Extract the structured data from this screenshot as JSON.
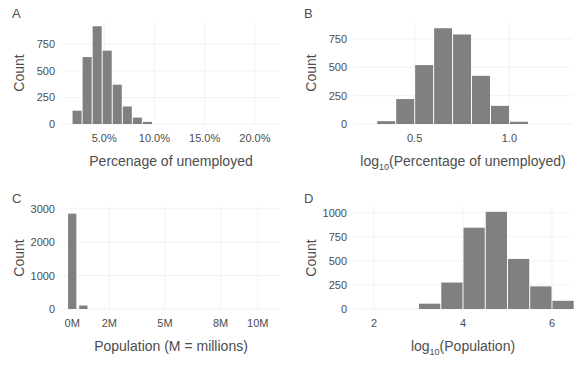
{
  "figure": {
    "width": 584,
    "height": 371,
    "background": "#ffffff",
    "bar_color": "#808080",
    "grid_color": "#f2f2f2",
    "text_color": "#4d4d4d"
  },
  "panels": [
    {
      "letter": "A",
      "ylabel": "Count",
      "xlabel": "Percenage of unemployed"
    },
    {
      "letter": "B",
      "ylabel": "Count",
      "xlabel_main": "log",
      "xlabel_sub": "10",
      "xlabel_rest": "(Percentage of unemployed)"
    },
    {
      "letter": "C",
      "ylabel": "Count",
      "xlabel": "Population (M = millions)"
    },
    {
      "letter": "D",
      "ylabel": "Count",
      "xlabel_main": "log",
      "xlabel_sub": "10",
      "xlabel_rest": "(Population)"
    }
  ],
  "chart_data": [
    {
      "type": "bar",
      "panel": "A",
      "title": "",
      "xlabel": "Percenage of unemployed",
      "ylabel": "Count",
      "xticks": [
        5,
        10,
        15,
        20
      ],
      "xticklabels": [
        "5.0%",
        "10.0%",
        "15.0%",
        "20.0%"
      ],
      "yticks": [
        0,
        250,
        500,
        750
      ],
      "yticklabels": [
        "0",
        "250",
        "500",
        "750"
      ],
      "xlim": [
        0.8,
        22.5
      ],
      "ylim": [
        0,
        960
      ],
      "bin_width": 1.0,
      "bin_starts": [
        1.8,
        2.8,
        3.8,
        4.8,
        5.8,
        6.8,
        7.8,
        8.8
      ],
      "values": [
        125,
        630,
        920,
        690,
        370,
        165,
        60,
        20
      ],
      "grid": true,
      "legend": "none"
    },
    {
      "type": "bar",
      "panel": "B",
      "title": "",
      "xlabel": "log10(Percentage of unemployed)",
      "ylabel": "Count",
      "xticks": [
        0.5,
        1.0
      ],
      "xticklabels": [
        "0.5",
        "1.0"
      ],
      "yticks": [
        0,
        250,
        500,
        750
      ],
      "yticklabels": [
        "0",
        "250",
        "500",
        "750"
      ],
      "xlim": [
        0.18,
        1.33
      ],
      "ylim": [
        0,
        900
      ],
      "bin_width": 0.1,
      "bin_starts": [
        0.3,
        0.4,
        0.5,
        0.6,
        0.7,
        0.8,
        0.9,
        1.0
      ],
      "values": [
        25,
        220,
        520,
        845,
        790,
        425,
        160,
        20
      ],
      "grid": true,
      "legend": "none"
    },
    {
      "type": "bar",
      "panel": "C",
      "title": "",
      "xlabel": "Population (M = millions)",
      "ylabel": "Count",
      "xticks": [
        0,
        2,
        5,
        8,
        10
      ],
      "xticklabels": [
        "0M",
        "2M",
        "5M",
        "8M",
        "10M"
      ],
      "yticks": [
        0,
        1000,
        2000,
        3000
      ],
      "yticklabels": [
        "0",
        "1000",
        "2000",
        "3000"
      ],
      "xlim": [
        -0.55,
        11.2
      ],
      "ylim": [
        0,
        3050
      ],
      "bin_width": 0.5,
      "bin_starts": [
        -0.25,
        0.35
      ],
      "values": [
        2850,
        105
      ],
      "grid": true,
      "legend": "none"
    },
    {
      "type": "bar",
      "panel": "D",
      "title": "",
      "xlabel": "log10(Population)",
      "ylabel": "Count",
      "xticks": [
        2,
        4,
        6
      ],
      "xticklabels": [
        "2",
        "4",
        "6"
      ],
      "yticks": [
        0,
        250,
        500,
        750,
        1000
      ],
      "yticklabels": [
        "0",
        "250",
        "500",
        "750",
        "1000"
      ],
      "xlim": [
        1.55,
        6.45
      ],
      "ylim": [
        0,
        1060
      ],
      "bin_width": 0.5,
      "bin_starts": [
        3.0,
        3.5,
        4.0,
        4.5,
        5.0,
        5.5,
        6.0
      ],
      "values": [
        55,
        275,
        845,
        1010,
        520,
        235,
        85
      ],
      "grid": true,
      "legend": "none"
    }
  ]
}
